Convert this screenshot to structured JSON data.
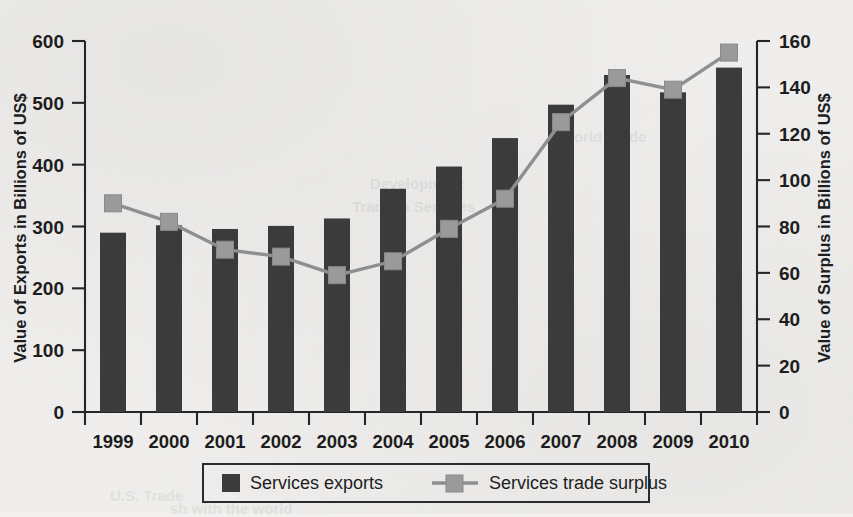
{
  "figure": {
    "clipped_title": "1999-2010",
    "background_color": "#f1f0ee",
    "bar_color": "#3b3b3b",
    "line_color": "#8f8f8f",
    "marker_color": "#9a9a9a",
    "axis_color": "#262626"
  },
  "chart_data": {
    "type": "bar",
    "title": "1999-2010",
    "xlabel": "",
    "ylabel": "Value of Exports in Billions of US$",
    "y2label": "Value of Surplus in Billions of US$",
    "categories": [
      "1999",
      "2000",
      "2001",
      "2002",
      "2003",
      "2004",
      "2005",
      "2006",
      "2007",
      "2008",
      "2009",
      "2010"
    ],
    "ylim": [
      0,
      600
    ],
    "y2lim": [
      0,
      160
    ],
    "yticks": [
      0,
      100,
      200,
      300,
      400,
      500,
      600
    ],
    "y2ticks": [
      0,
      20,
      40,
      60,
      80,
      100,
      120,
      140,
      160
    ],
    "grid": false,
    "legend_position": "bottom",
    "series": [
      {
        "name": "Services exports",
        "kind": "bar",
        "axis": "left",
        "color": "#3b3b3b",
        "values": [
          290,
          302,
          296,
          301,
          313,
          361,
          397,
          443,
          497,
          545,
          517,
          557
        ]
      },
      {
        "name": "Services trade surplus",
        "kind": "line",
        "axis": "right",
        "color": "#8f8f8f",
        "values": [
          90,
          82,
          70,
          67,
          59,
          65,
          79,
          92,
          125,
          144,
          139,
          155
        ]
      }
    ]
  },
  "axes": {
    "left": {
      "title": "Value of Exports in Billions of US$",
      "tick_labels": [
        "600",
        "500",
        "400",
        "300",
        "200",
        "100",
        "0"
      ]
    },
    "right": {
      "title": "Value of Surplus in Billions of US$",
      "tick_labels": [
        "160",
        "140",
        "120",
        "100",
        "80",
        "60",
        "40",
        "20",
        "0"
      ]
    },
    "bottom": {
      "tick_labels": [
        "1999",
        "2000",
        "2001",
        "2002",
        "2003",
        "2004",
        "2005",
        "2006",
        "2007",
        "2008",
        "2009",
        "2010"
      ]
    }
  },
  "legend": {
    "items": [
      {
        "label": "Services exports",
        "marker": "square-swatch"
      },
      {
        "label": "Services trade surplus",
        "marker": "line-with-square-marker"
      }
    ]
  },
  "background_text": {
    "lines": [
      "Development",
      "Trade in Services",
      "World Trade",
      "U.S. Trade",
      "sh with the world"
    ]
  }
}
